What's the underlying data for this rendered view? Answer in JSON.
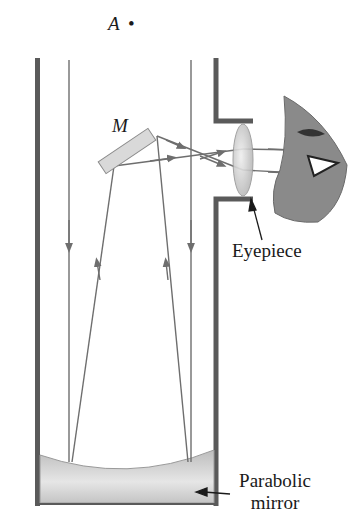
{
  "diagram": {
    "labels": {
      "point_a": "A",
      "point_a_dot": "•",
      "flat_mirror": "M",
      "eyepiece": "Eyepiece",
      "parabolic_mirror_line1": "Parabolic",
      "parabolic_mirror_line2": "mirror"
    },
    "colors": {
      "tube_wall": "#5a5a5a",
      "ray": "#6e6e6e",
      "mirror_fill": "#d9d9d9",
      "lens_fill": "#cfcfcf",
      "eye_fill": "#8a8a8a",
      "parabolic_fill": "#c8c8c8"
    }
  }
}
